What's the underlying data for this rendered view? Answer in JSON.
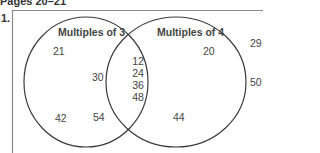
{
  "header": {
    "title": "Pages 20–21"
  },
  "question": {
    "number": "1."
  },
  "diagram": {
    "type": "venn",
    "sets": [
      {
        "label": "Multiples of 3",
        "only": [
          "21",
          "30",
          "42",
          "54"
        ]
      },
      {
        "label": "Multiples of 4",
        "only": [
          "20",
          "44"
        ]
      }
    ],
    "intersection": [
      "12",
      "24",
      "36",
      "48"
    ],
    "outside": [
      "29",
      "50"
    ],
    "colors": {
      "line": "#3a3a3a",
      "frame": "#888888",
      "text": "#444444"
    }
  }
}
